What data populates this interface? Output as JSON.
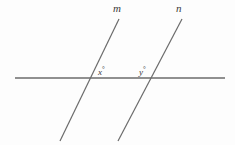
{
  "figure": {
    "background_color": "#fdfdfd",
    "stroke_color": "#6b6b6b",
    "label_color": "#3a3a3a",
    "width": 235,
    "height": 145
  },
  "labels": {
    "line_m": "m",
    "line_n": "n",
    "angle_x": "x",
    "angle_y": "y",
    "degree_symbol": "°"
  },
  "chart_data": {
    "type": "diagram",
    "xlim": [
      0,
      235
    ],
    "ylim": [
      0,
      145
    ],
    "grid": false,
    "legend": "none",
    "elements": [
      {
        "name": "transversal",
        "kind": "segment",
        "label": "",
        "x1": 15,
        "y1": 78,
        "x2": 225,
        "y2": 78,
        "color": "#6b6b6b",
        "width": 1.5
      },
      {
        "name": "line-m",
        "kind": "segment",
        "label": "m",
        "x1": 119,
        "y1": 19,
        "x2": 60,
        "y2": 141,
        "color": "#6b6b6b",
        "width": 1.2
      },
      {
        "name": "line-n",
        "kind": "segment",
        "label": "n",
        "x1": 182,
        "y1": 19,
        "x2": 118,
        "y2": 141,
        "color": "#6b6b6b",
        "width": 1.2
      }
    ],
    "annotations": [
      {
        "name": "label-m",
        "text": "m",
        "x": 117,
        "y": 10
      },
      {
        "name": "label-n",
        "text": "n",
        "x": 180,
        "y": 10
      },
      {
        "name": "angle-x",
        "text": "x°",
        "x": 103,
        "y": 71
      },
      {
        "name": "angle-y",
        "text": "y°",
        "x": 144,
        "y": 71
      }
    ],
    "intersections": [
      {
        "name": "m-transversal",
        "x": 91,
        "y": 78,
        "angle_label": "x°"
      },
      {
        "name": "n-transversal",
        "x": 150,
        "y": 78,
        "angle_label": "y°"
      }
    ]
  }
}
